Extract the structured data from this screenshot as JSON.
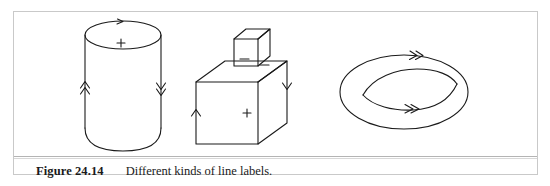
{
  "figure": {
    "caption_label": "Figure 24.14",
    "caption_text": "Different kinds of line labels.",
    "frame_color": "#c9c9c9",
    "ink_color": "#1a1a1a",
    "background": "#ffffff"
  },
  "objects": [
    {
      "id": "cylinder",
      "name": "cylinder",
      "surface_label": "+",
      "edge_labels": [
        {
          "position": "top-ellipse",
          "arrow": "single",
          "direction": "right"
        },
        {
          "position": "left-side",
          "arrow": "double",
          "direction": "up"
        },
        {
          "position": "right-side",
          "arrow": "double",
          "direction": "down"
        }
      ]
    },
    {
      "id": "stacked-boxes",
      "name": "small cube on large box",
      "surface_labels": [
        "-",
        "-",
        "+"
      ],
      "edge_labels": [
        {
          "position": "left-side",
          "arrow": "single",
          "direction": "up"
        },
        {
          "position": "right-side",
          "arrow": "single",
          "direction": "down"
        }
      ]
    },
    {
      "id": "torus",
      "name": "torus",
      "edge_labels": [
        {
          "position": "outer-ellipse-top",
          "arrow": "double",
          "direction": "right"
        },
        {
          "position": "inner-lens-bottom",
          "arrow": "double",
          "direction": "right"
        }
      ]
    }
  ]
}
